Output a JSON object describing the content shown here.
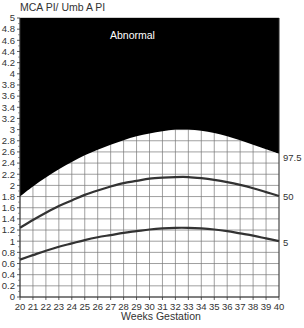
{
  "chart_data": {
    "type": "line",
    "title": "",
    "ylabel": "MCA PI/ Umb A PI",
    "xlabel": "Weeks Gestation",
    "xlim": [
      20,
      40
    ],
    "ylim": [
      0,
      5
    ],
    "grid": true,
    "x_ticks": [
      20,
      21,
      22,
      23,
      24,
      25,
      26,
      27,
      28,
      29,
      30,
      31,
      32,
      33,
      34,
      35,
      36,
      37,
      38,
      39,
      40
    ],
    "y_ticks": [
      "0",
      "0.2",
      "0.4",
      "0.6",
      "0.8",
      "1",
      "1.2",
      "1.4",
      "1.6",
      "1.8",
      "2",
      "2.2",
      "2.4",
      "2.6",
      "2.8",
      "3",
      "3.2",
      "3.4",
      "3.6",
      "3.8",
      "4",
      "4.2",
      "4.4",
      "4.6",
      "4.8",
      "5"
    ],
    "x": [
      20,
      21,
      22,
      23,
      24,
      25,
      26,
      27,
      28,
      29,
      30,
      31,
      32,
      33,
      34,
      35,
      36,
      37,
      38,
      39,
      40
    ],
    "series": [
      {
        "name": "97.5",
        "values": [
          1.8,
          1.98,
          2.14,
          2.29,
          2.42,
          2.54,
          2.64,
          2.73,
          2.81,
          2.88,
          2.93,
          2.97,
          3.0,
          3.0,
          2.98,
          2.94,
          2.88,
          2.81,
          2.73,
          2.65,
          2.57
        ]
      },
      {
        "name": "50",
        "values": [
          1.24,
          1.38,
          1.51,
          1.63,
          1.73,
          1.83,
          1.91,
          1.98,
          2.04,
          2.08,
          2.12,
          2.14,
          2.15,
          2.15,
          2.13,
          2.1,
          2.06,
          2.01,
          1.95,
          1.88,
          1.81
        ]
      },
      {
        "name": "5",
        "values": [
          0.67,
          0.75,
          0.83,
          0.9,
          0.96,
          1.02,
          1.07,
          1.11,
          1.15,
          1.18,
          1.21,
          1.23,
          1.24,
          1.24,
          1.23,
          1.21,
          1.18,
          1.14,
          1.1,
          1.05,
          1.0
        ]
      }
    ],
    "annotations": [
      {
        "text": "Abnormal",
        "region": "above 97.5 percentile (filled black)"
      }
    ],
    "series_labels_position": "right"
  },
  "labels": {
    "y_title": "MCA PI/ Umb A PI",
    "x_title": "Weeks Gestation",
    "abnormal": "Abnormal",
    "p975": "97.5",
    "p50": "50",
    "p5": "5"
  },
  "colors": {
    "abnormal_fill": "#000000",
    "curve": "#333333",
    "grid": "#777777",
    "text": "#333333"
  }
}
